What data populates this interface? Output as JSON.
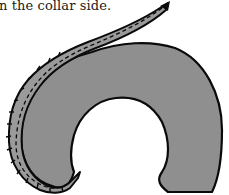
{
  "document": {
    "caption_text": "n the collar side."
  },
  "figure": {
    "colors": {
      "fill": "#8f8f8f",
      "stroke": "#0a0a0a",
      "strip_fill": "#9a9a9a",
      "background": "#ffffff"
    }
  }
}
